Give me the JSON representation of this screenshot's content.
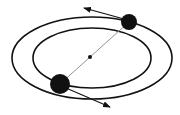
{
  "diagram": {
    "type": "binary-orbit",
    "colors": {
      "stroke": "#111111",
      "line": "#888888",
      "background": "#ffffff"
    },
    "orbits": [
      {
        "name": "outer-orbit",
        "cx": 92,
        "cy": 58,
        "rx": 80,
        "ry": 41
      },
      {
        "name": "inner-orbit",
        "cx": 92,
        "cy": 58,
        "rx": 59,
        "ry": 30
      }
    ],
    "bodies": [
      {
        "name": "small-body",
        "cx": 129,
        "cy": 22,
        "r": 8
      },
      {
        "name": "large-body",
        "cx": 60,
        "cy": 84,
        "r": 10
      }
    ],
    "center_of_mass": {
      "cx": 90,
      "cy": 57,
      "r": 2
    },
    "velocity_arrows": [
      {
        "name": "small-body-velocity",
        "x1": 124,
        "y1": 19,
        "x2": 84,
        "y2": 8
      },
      {
        "name": "large-body-velocity",
        "x1": 66,
        "y1": 88,
        "x2": 110,
        "y2": 107
      }
    ]
  }
}
